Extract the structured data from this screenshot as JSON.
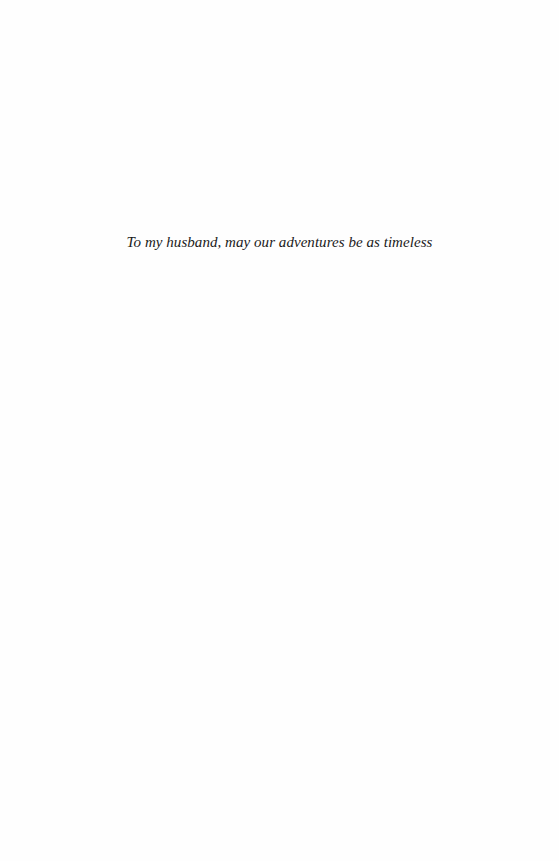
{
  "page": {
    "background_color": "#fefefe",
    "text_color": "#1a1a1a"
  },
  "dedication": {
    "text": "To my husband, may our adventures be as timeless"
  }
}
